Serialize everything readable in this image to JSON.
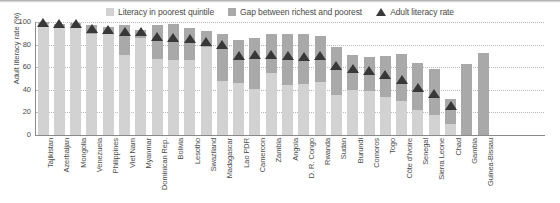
{
  "legend": {
    "items": [
      {
        "label": "Literacy in poorest quintile",
        "icon": "square-swatch",
        "color": "#d2d2d2"
      },
      {
        "label": "Gap between richest and poorest",
        "icon": "square-swatch",
        "color": "#a9a9a9"
      },
      {
        "label": "Adult literacy rate",
        "icon": "triangle-marker",
        "color": "#383838"
      }
    ]
  },
  "axis": {
    "ylabel": "Adult literacy rate (%)",
    "yticks": [
      "0",
      "20",
      "40",
      "60",
      "80",
      "100"
    ]
  },
  "chart_data": {
    "type": "bar",
    "title": "",
    "subtitle": "",
    "xlabel": "",
    "ylabel": "Adult literacy rate (%)",
    "ylim": [
      0,
      100
    ],
    "ytick_values": [
      0,
      20,
      40,
      60,
      80,
      100
    ],
    "grid": true,
    "legend_position": "top-center",
    "stacked": true,
    "categories": [
      "Tajikistan",
      "Azerbaijan",
      "Mongolia",
      "Venezuela",
      "Philippines",
      "Viet Nam",
      "Myanmar",
      "Dominican Rep.",
      "Bolivia",
      "Lesotho",
      "Swaziland",
      "Madagascar",
      "Lao PDR",
      "Cameroon",
      "Zambia",
      "Angola",
      "D. R. Congo",
      "Rwanda",
      "Sudan",
      "Burundi",
      "Comoros",
      "Togo",
      "Côte d'Ivoire",
      "Senegal",
      "Sierra Leone",
      "Chad",
      "Gambia",
      "Guinea-Bissau"
    ],
    "series": [
      {
        "name": "Literacy in poorest quintile",
        "color": "#d2d2d2",
        "values": [
          98,
          96,
          97,
          89,
          89,
          71,
          86,
          67,
          66,
          66,
          78,
          48,
          46,
          41,
          55,
          44,
          45,
          47,
          35,
          40,
          39,
          34,
          30,
          22,
          18,
          10,
          null,
          null
        ]
      },
      {
        "name": "Gap between richest and poorest",
        "color": "#a9a9a9",
        "values": [
          2,
          2,
          2,
          8,
          7,
          26,
          7,
          30,
          32,
          29,
          14,
          41,
          38,
          45,
          34,
          45,
          44,
          41,
          43,
          31,
          30,
          36,
          42,
          42,
          40,
          22,
          63,
          73
        ]
      }
    ],
    "markers": {
      "name": "Adult literacy rate",
      "color": "#383838",
      "values": [
        99,
        98,
        98,
        94,
        93,
        91,
        91,
        87,
        86,
        85,
        82,
        80,
        70,
        71,
        71,
        70,
        69,
        70,
        61,
        58,
        57,
        53,
        49,
        42,
        36,
        26,
        null,
        null
      ]
    }
  }
}
